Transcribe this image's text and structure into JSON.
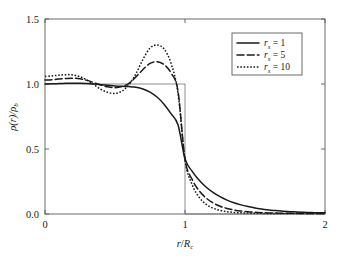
{
  "chart_data": {
    "type": "line",
    "title": "",
    "xlabel": "r/R_c",
    "ylabel": "ρ(r)/ρ_b",
    "xlabel_parts": {
      "num": "r",
      "den": "R",
      "den_sub": "c"
    },
    "ylabel_parts": {
      "rho1": "ρ",
      "arg": "(r)",
      "slash": "/",
      "rho2": "ρ",
      "sub": "b"
    },
    "xlim": [
      0,
      2
    ],
    "ylim": [
      0.0,
      1.5
    ],
    "xticks": [
      0,
      1,
      2
    ],
    "xtick_labels": [
      "0",
      "1",
      "2"
    ],
    "yticks": [
      0.0,
      0.5,
      1.0,
      1.5
    ],
    "ytick_labels": [
      "0.0",
      "0.5",
      "1.0",
      "1.5"
    ],
    "grid": false,
    "legend_position": "upper right",
    "legend_entries": [
      {
        "label_prefix": "r",
        "label_sub": "s",
        "label_eq": "= 1",
        "value": "1",
        "style": "solid"
      },
      {
        "label_prefix": "r",
        "label_sub": "s",
        "label_eq": "= 5",
        "value": "5",
        "style": "dashed"
      },
      {
        "label_prefix": "r",
        "label_sub": "s",
        "label_eq": "= 10",
        "value": "10",
        "style": "dotted"
      }
    ],
    "series": [
      {
        "name": "r_s = 1",
        "style": "solid",
        "color": "#1a1a1a",
        "x": [
          0.0,
          0.05,
          0.1,
          0.15,
          0.2,
          0.25,
          0.3,
          0.35,
          0.4,
          0.45,
          0.5,
          0.55,
          0.6,
          0.65,
          0.7,
          0.75,
          0.8,
          0.85,
          0.9,
          0.95,
          1.0,
          1.05,
          1.1,
          1.15,
          1.2,
          1.25,
          1.3,
          1.35,
          1.4,
          1.45,
          1.5,
          1.55,
          1.6,
          1.65,
          1.7,
          1.75,
          1.8,
          1.85,
          1.9,
          1.95,
          2.0
        ],
        "y": [
          1.0,
          1.001,
          1.003,
          1.005,
          1.006,
          1.006,
          1.004,
          1.0,
          0.995,
          0.99,
          0.985,
          0.982,
          0.98,
          0.975,
          0.962,
          0.938,
          0.9,
          0.845,
          0.772,
          0.686,
          0.425,
          0.33,
          0.262,
          0.208,
          0.166,
          0.133,
          0.107,
          0.086,
          0.07,
          0.057,
          0.046,
          0.038,
          0.031,
          0.026,
          0.021,
          0.018,
          0.015,
          0.013,
          0.011,
          0.01,
          0.009
        ]
      },
      {
        "name": "r_s = 5",
        "style": "dashed",
        "color": "#1a1a1a",
        "x": [
          0.0,
          0.05,
          0.1,
          0.15,
          0.2,
          0.25,
          0.3,
          0.35,
          0.4,
          0.45,
          0.5,
          0.55,
          0.6,
          0.65,
          0.7,
          0.75,
          0.8,
          0.85,
          0.9,
          0.95,
          1.0,
          1.05,
          1.1,
          1.15,
          1.2,
          1.25,
          1.3,
          1.35,
          1.4,
          1.45,
          1.5,
          1.55,
          1.6,
          1.65,
          1.7,
          1.75,
          1.8,
          1.85,
          1.9,
          1.95,
          2.0
        ],
        "y": [
          1.03,
          1.033,
          1.038,
          1.042,
          1.044,
          1.04,
          1.028,
          1.01,
          0.992,
          0.978,
          0.972,
          0.98,
          1.005,
          1.055,
          1.112,
          1.158,
          1.172,
          1.15,
          1.085,
          0.945,
          0.42,
          0.268,
          0.18,
          0.124,
          0.086,
          0.06,
          0.043,
          0.031,
          0.023,
          0.017,
          0.013,
          0.01,
          0.008,
          0.007,
          0.006,
          0.005,
          0.005,
          0.004,
          0.004,
          0.004,
          0.004
        ]
      },
      {
        "name": "r_s = 10",
        "style": "dotted",
        "color": "#1a1a1a",
        "x": [
          0.0,
          0.05,
          0.1,
          0.15,
          0.2,
          0.25,
          0.3,
          0.35,
          0.4,
          0.45,
          0.5,
          0.55,
          0.6,
          0.65,
          0.7,
          0.75,
          0.8,
          0.85,
          0.9,
          0.95,
          1.0,
          1.05,
          1.1,
          1.15,
          1.2,
          1.25,
          1.3,
          1.35,
          1.4,
          1.45,
          1.5,
          1.55,
          1.6,
          1.65,
          1.7,
          1.75,
          1.8,
          1.85,
          1.9,
          1.95,
          2.0
        ],
        "y": [
          1.058,
          1.062,
          1.068,
          1.072,
          1.07,
          1.056,
          1.03,
          0.995,
          0.958,
          0.935,
          0.928,
          0.945,
          0.995,
          1.08,
          1.19,
          1.276,
          1.3,
          1.27,
          1.16,
          0.93,
          0.415,
          0.228,
          0.13,
          0.075,
          0.045,
          0.028,
          0.018,
          0.012,
          0.009,
          0.007,
          0.006,
          0.005,
          0.004,
          0.004,
          0.004,
          0.003,
          0.003,
          0.003,
          0.003,
          0.003,
          0.003
        ]
      },
      {
        "name": "step-function reference",
        "style": "step",
        "color": "#6e6e6e",
        "x": [
          0.0,
          1.0,
          1.0,
          2.0
        ],
        "y": [
          1.0,
          1.0,
          0.0,
          0.0
        ]
      }
    ]
  }
}
